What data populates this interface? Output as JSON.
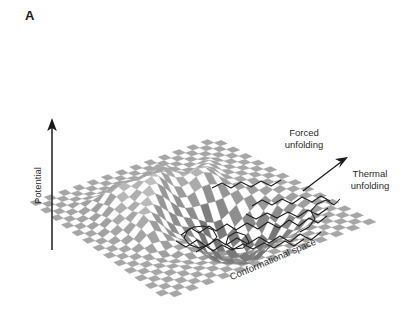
{
  "figure": {
    "panel_label": "A",
    "background_color": "#ffffff",
    "text_color": "#2b2b2b",
    "surface_color_dark": "#8a8a8a",
    "surface_color_light": "#ffffff",
    "contour_color": "#1f1f1f",
    "arrow_color": "#1a1a1a"
  },
  "axes": {
    "vertical_label": "Potential",
    "diagonal_label": "Conformational space"
  },
  "annotations": {
    "forced_line1": "Forced",
    "forced_line2": "unfolding",
    "thermal_line1": "Thermal",
    "thermal_line2": "unfolding"
  },
  "chart_data": {
    "type": "surface",
    "title": "",
    "subtitle": "",
    "xlabel": "Conformational space",
    "ylabel": "Potential",
    "zlabel": "",
    "legend_position": "none",
    "grid": false,
    "projection": "isometric-diamond",
    "domain_vertices_px": {
      "left": [
        30,
        202
      ],
      "top": [
        215,
        137
      ],
      "right": [
        376,
        222
      ],
      "bottom": [
        166,
        300
      ]
    },
    "grid_divisions_u": 26,
    "grid_divisions_v": 26,
    "checker_cells_total": 676,
    "surface_features": [
      {
        "name": "folding-funnel-basin",
        "center_uv": [
          0.58,
          0.62
        ],
        "relative_depth": -1.0
      },
      {
        "name": "back-ridge",
        "center_uv": [
          0.42,
          0.3
        ],
        "relative_height": 0.55
      },
      {
        "name": "left-shoulder",
        "center_uv": [
          0.28,
          0.45
        ],
        "relative_height": 0.22
      },
      {
        "name": "flat-periphery",
        "center_uv": [
          0.05,
          0.05
        ],
        "relative_height": 0.0
      }
    ],
    "height_scale_px": 46,
    "annotations": [
      {
        "text": "Forced unfolding",
        "anchor_px": [
          304,
          138
        ],
        "role": "pathway-label"
      },
      {
        "text": "Thermal unfolding",
        "anchor_px": [
          370,
          180
        ],
        "role": "pathway-label"
      },
      {
        "text": "Potential",
        "anchor_px": [
          38,
          200
        ],
        "role": "axis-label",
        "rotation_deg": -90
      },
      {
        "text": "Conformational space",
        "anchor_px": [
          235,
          272
        ],
        "role": "axis-label",
        "rotation_deg": -23
      }
    ],
    "arrows": [
      {
        "name": "potential-axis-arrow",
        "from_px": [
          52,
          250
        ],
        "to_px": [
          52,
          121
        ],
        "head": "solid"
      },
      {
        "name": "unfolding-pathway-arrow",
        "from_px": [
          303,
          191
        ],
        "to_px": [
          346,
          158
        ],
        "head": "solid"
      }
    ]
  }
}
